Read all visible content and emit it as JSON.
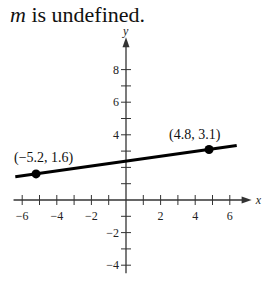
{
  "caption": {
    "variable": "m",
    "text": " is undefined."
  },
  "chart_data": {
    "type": "line",
    "title": "m is undefined.",
    "xlabel": "x",
    "ylabel": "y",
    "xlim": [
      -6.5,
      6.8
    ],
    "ylim": [
      -4.5,
      9.5
    ],
    "x_ticks": [
      -6,
      -5,
      -4,
      -3,
      -2,
      -1,
      1,
      2,
      3,
      4,
      5,
      6
    ],
    "x_tick_labels": [
      "-6",
      "-4",
      "-2",
      "2",
      "4",
      "6"
    ],
    "y_ticks": [
      -4,
      -3,
      -2,
      -1,
      1,
      2,
      3,
      4,
      5,
      6,
      7,
      8
    ],
    "y_tick_labels": [
      "8",
      "6",
      "4",
      "-2",
      "-4"
    ],
    "grid": false,
    "series": [
      {
        "name": "line",
        "points": [
          {
            "x": -5.2,
            "y": 1.6
          },
          {
            "x": 4.8,
            "y": 3.1
          }
        ],
        "extends_beyond_points": true
      }
    ],
    "annotations": [
      {
        "text": "(−5.2, 1.6)",
        "x": -5.2,
        "y": 1.6
      },
      {
        "text": "(4.8, 3.1)",
        "x": 4.8,
        "y": 3.1
      }
    ]
  }
}
